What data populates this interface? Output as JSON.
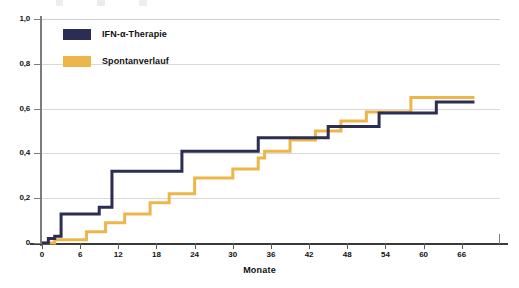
{
  "chart_data": {
    "type": "line",
    "subtype": "step",
    "title": "",
    "xlabel": "Monate",
    "ylabel": "",
    "xlim": [
      0,
      72
    ],
    "ylim": [
      0,
      1.0
    ],
    "grid": true,
    "legend_position": "top-left",
    "xticks": [
      0,
      6,
      12,
      18,
      24,
      30,
      36,
      42,
      48,
      54,
      60,
      66
    ],
    "xtick_labels": [
      "0",
      "6",
      "12",
      "18",
      "24",
      "30",
      "36",
      "42",
      "48",
      "54",
      "60",
      "66"
    ],
    "yticks": [
      0,
      0.2,
      0.4,
      0.6,
      0.8,
      1.0
    ],
    "ytick_labels": [
      "0",
      "0,2",
      "0,4",
      "0,6",
      "0,8",
      "1,0"
    ],
    "series": [
      {
        "name": "IFN-α-Therapie",
        "color": "#2b2d52",
        "steps": [
          [
            0,
            0.0
          ],
          [
            1,
            0.02
          ],
          [
            2,
            0.03
          ],
          [
            3,
            0.13
          ],
          [
            8,
            0.13
          ],
          [
            9,
            0.16
          ],
          [
            11,
            0.32
          ],
          [
            21,
            0.32
          ],
          [
            22,
            0.41
          ],
          [
            33,
            0.41
          ],
          [
            34,
            0.47
          ],
          [
            44,
            0.47
          ],
          [
            45,
            0.52
          ],
          [
            52,
            0.52
          ],
          [
            53,
            0.58
          ],
          [
            61,
            0.58
          ],
          [
            62,
            0.63
          ],
          [
            68,
            0.63
          ]
        ]
      },
      {
        "name": "Spontanverlauf",
        "color": "#edb64a",
        "steps": [
          [
            0,
            0.0
          ],
          [
            2,
            0.015
          ],
          [
            6,
            0.015
          ],
          [
            7,
            0.05
          ],
          [
            9,
            0.05
          ],
          [
            10,
            0.09
          ],
          [
            12,
            0.09
          ],
          [
            13,
            0.13
          ],
          [
            16,
            0.13
          ],
          [
            17,
            0.18
          ],
          [
            19,
            0.18
          ],
          [
            20,
            0.22
          ],
          [
            23,
            0.22
          ],
          [
            24,
            0.29
          ],
          [
            29,
            0.29
          ],
          [
            30,
            0.33
          ],
          [
            33,
            0.33
          ],
          [
            34,
            0.38
          ],
          [
            35,
            0.41
          ],
          [
            38,
            0.41
          ],
          [
            39,
            0.46
          ],
          [
            42,
            0.46
          ],
          [
            43,
            0.5
          ],
          [
            46,
            0.5
          ],
          [
            47,
            0.545
          ],
          [
            50,
            0.545
          ],
          [
            51,
            0.585
          ],
          [
            57,
            0.585
          ],
          [
            58,
            0.65
          ],
          [
            68,
            0.65
          ]
        ]
      }
    ]
  },
  "legend": {
    "items": [
      {
        "label": "IFN-α-Therapie",
        "color": "#2b2d52"
      },
      {
        "label": "Spontanverlauf",
        "color": "#edb64a"
      }
    ]
  },
  "axes": {
    "x_title": "Monate"
  },
  "colors": {
    "navy": "#2b2d52",
    "gold": "#edb64a",
    "grid": "#d9d9d9",
    "axis": "#5a5a5a"
  }
}
